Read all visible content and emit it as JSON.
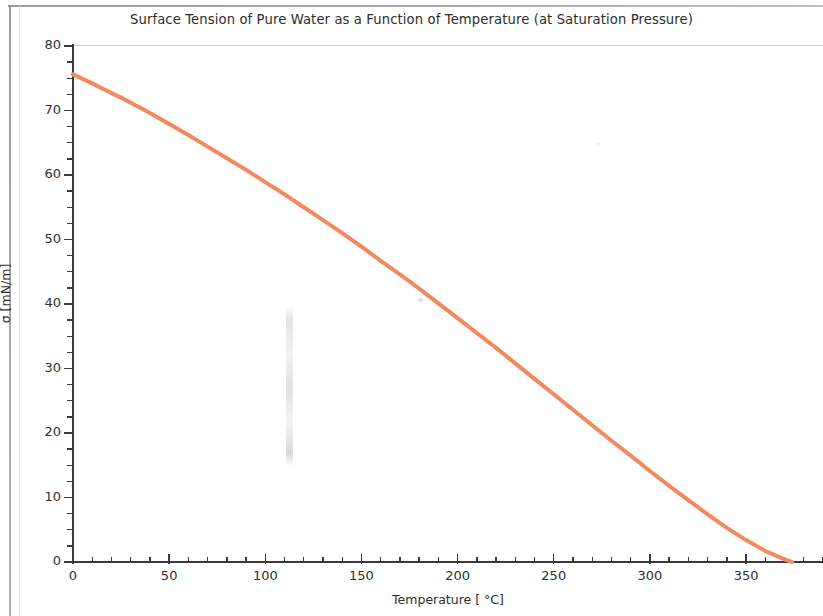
{
  "chart_data": {
    "type": "line",
    "title": "Surface Tension of Pure Water as a Function of Temperature (at Saturation Pressure)",
    "xlabel": "Temperature [ °C]",
    "ylabel": "σ [mN/m]",
    "xlim": [
      0,
      390
    ],
    "ylim": [
      0,
      80
    ],
    "xticks": [
      0,
      50,
      100,
      150,
      200,
      250,
      300,
      350
    ],
    "yticks": [
      0,
      10,
      20,
      30,
      40,
      50,
      60,
      70,
      80
    ],
    "x_minor_step": 10,
    "y_minor_step": 2.5,
    "grid": false,
    "legend": null,
    "line_color": "#F2895F",
    "line_width": 4,
    "series": [
      {
        "name": "Surface tension of saturated pure water",
        "x": [
          0,
          10,
          20,
          25,
          30,
          40,
          50,
          60,
          70,
          80,
          90,
          100,
          110,
          120,
          130,
          140,
          150,
          160,
          170,
          180,
          190,
          200,
          210,
          220,
          230,
          240,
          250,
          260,
          270,
          280,
          290,
          300,
          310,
          320,
          330,
          340,
          350,
          360,
          370,
          373.95
        ],
        "values": [
          75.6,
          74.2,
          72.7,
          72.0,
          71.2,
          69.6,
          67.9,
          66.2,
          64.4,
          62.6,
          60.8,
          58.9,
          57.0,
          55.0,
          53.0,
          51.0,
          48.9,
          46.7,
          44.6,
          42.4,
          40.1,
          37.8,
          35.5,
          33.2,
          30.8,
          28.4,
          26.0,
          23.6,
          21.2,
          18.8,
          16.5,
          14.1,
          11.8,
          9.6,
          7.4,
          5.3,
          3.4,
          1.7,
          0.4,
          0.0
        ]
      }
    ],
    "annotations": []
  },
  "axis": {
    "y_tick_labels": [
      "80",
      "70",
      "60",
      "50",
      "40",
      "30",
      "20",
      "10",
      "0"
    ],
    "x_tick_labels": [
      "0",
      "50",
      "100",
      "150",
      "200",
      "250",
      "300",
      "350"
    ]
  }
}
